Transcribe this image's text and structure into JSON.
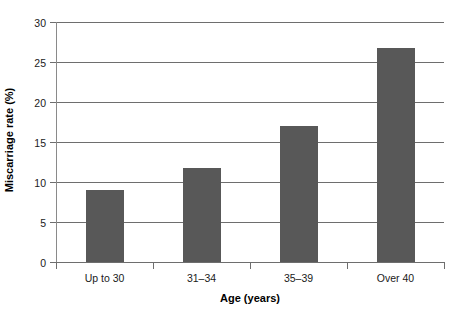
{
  "chart_data": {
    "type": "bar",
    "title": "",
    "subtitle": "",
    "xlabel": "Age (years)",
    "ylabel": "Miscarriage rate (%)",
    "categories": [
      "Up to 30",
      "31–34",
      "35–39",
      "Over 40"
    ],
    "values": [
      9.0,
      11.8,
      17.0,
      26.8
    ],
    "ylim": [
      0,
      30
    ],
    "yticks": [
      0,
      5,
      10,
      15,
      20,
      25,
      30
    ],
    "ytick_labels": [
      "0",
      "5",
      "10",
      "15",
      "20",
      "25",
      "30"
    ],
    "grid": "horizontal",
    "legend": "none",
    "series": [
      {
        "name": "Miscarriage rate",
        "values": [
          9.0,
          11.8,
          17.0,
          26.8
        ],
        "color": "#585858"
      }
    ]
  },
  "colors": {
    "bar": "#585858",
    "grid": "#6e6e6e",
    "axis": "#6e6e6e",
    "background": "#ffffff",
    "text": "#1a1a1a"
  }
}
